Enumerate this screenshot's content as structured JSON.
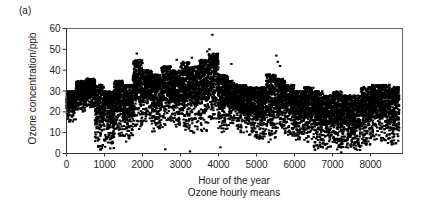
{
  "panel_label": "(a)",
  "chart_data": {
    "type": "scatter",
    "title": "",
    "xlabel": "Hour of the year",
    "subtitle": "Ozone hourly means",
    "ylabel": "Ozone concentration/ppb",
    "xlim": [
      0,
      8760
    ],
    "ylim": [
      0,
      60
    ],
    "xticks": [
      0,
      1000,
      2000,
      3000,
      4000,
      5000,
      6000,
      7000,
      8000
    ],
    "yticks": [
      0,
      10,
      20,
      30,
      40,
      50,
      60
    ],
    "grid": false,
    "legend": null,
    "marker_color": "#000000",
    "envelope_bin_hours": 250,
    "envelope": [
      {
        "x": 125,
        "low": 15,
        "high": 30
      },
      {
        "x": 375,
        "low": 20,
        "high": 35
      },
      {
        "x": 625,
        "low": 22,
        "high": 36
      },
      {
        "x": 875,
        "low": 0,
        "high": 33
      },
      {
        "x": 1125,
        "low": 2,
        "high": 30
      },
      {
        "x": 1375,
        "low": 8,
        "high": 35
      },
      {
        "x": 1625,
        "low": 5,
        "high": 33
      },
      {
        "x": 1875,
        "low": 10,
        "high": 45
      },
      {
        "x": 2125,
        "low": 15,
        "high": 40
      },
      {
        "x": 2375,
        "low": 10,
        "high": 38
      },
      {
        "x": 2625,
        "low": 12,
        "high": 42
      },
      {
        "x": 2875,
        "low": 12,
        "high": 40
      },
      {
        "x": 3125,
        "low": 10,
        "high": 44
      },
      {
        "x": 3375,
        "low": 8,
        "high": 42
      },
      {
        "x": 3625,
        "low": 10,
        "high": 45
      },
      {
        "x": 3875,
        "low": 15,
        "high": 48
      },
      {
        "x": 4125,
        "low": 10,
        "high": 38
      },
      {
        "x": 4375,
        "low": 12,
        "high": 35
      },
      {
        "x": 4625,
        "low": 10,
        "high": 33
      },
      {
        "x": 4875,
        "low": 8,
        "high": 32
      },
      {
        "x": 5125,
        "low": 6,
        "high": 32
      },
      {
        "x": 5375,
        "low": 5,
        "high": 38
      },
      {
        "x": 5625,
        "low": 10,
        "high": 36
      },
      {
        "x": 5875,
        "low": 8,
        "high": 33
      },
      {
        "x": 6125,
        "low": 5,
        "high": 30
      },
      {
        "x": 6375,
        "low": 5,
        "high": 32
      },
      {
        "x": 6625,
        "low": 0,
        "high": 30
      },
      {
        "x": 6875,
        "low": 2,
        "high": 28
      },
      {
        "x": 7125,
        "low": 0,
        "high": 30
      },
      {
        "x": 7375,
        "low": 2,
        "high": 28
      },
      {
        "x": 7625,
        "low": 0,
        "high": 28
      },
      {
        "x": 7875,
        "low": 2,
        "high": 32
      },
      {
        "x": 8125,
        "low": 5,
        "high": 33
      },
      {
        "x": 8375,
        "low": 5,
        "high": 33
      },
      {
        "x": 8630,
        "low": 3,
        "high": 32
      }
    ],
    "outliers": [
      {
        "x": 3840,
        "y": 57
      },
      {
        "x": 3760,
        "y": 50
      },
      {
        "x": 3700,
        "y": 49
      },
      {
        "x": 4340,
        "y": 43
      },
      {
        "x": 5520,
        "y": 47
      },
      {
        "x": 5560,
        "y": 44
      },
      {
        "x": 5620,
        "y": 42
      },
      {
        "x": 1850,
        "y": 48
      },
      {
        "x": 2900,
        "y": 45
      },
      {
        "x": 3300,
        "y": 46
      },
      {
        "x": 1450,
        "y": 10
      },
      {
        "x": 2600,
        "y": 2
      },
      {
        "x": 3250,
        "y": 1
      },
      {
        "x": 4050,
        "y": 3
      }
    ]
  }
}
